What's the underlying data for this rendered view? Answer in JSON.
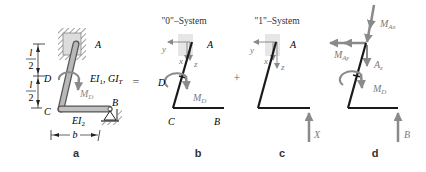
{
  "colors": {
    "beam": "#1a1a1a",
    "beam_3d_fill": "#9a9a9a",
    "beam_3d_edge": "#555555",
    "force_gray": "#8a8a8a",
    "label_gray": "#7a7a7a",
    "support_fill": "#e2e2e2",
    "hatch": "#444444"
  },
  "panels": {
    "a": {
      "caption": "a",
      "points": {
        "A": "A",
        "B": "B",
        "C": "C",
        "D": "D"
      },
      "stiffness_upper": "EI₁, GIᵀ",
      "stiffness_upper_parts": {
        "EI": "EI",
        "sub1": "1",
        "sep": ", ",
        "GI": "GI",
        "subT": "T"
      },
      "stiffness_lower_parts": {
        "EI": "EI",
        "sub2": "2"
      },
      "moment": {
        "M": "M",
        "sub": "D"
      },
      "dim_half_num": "l",
      "dim_half_den": "2",
      "dim_width": "b"
    },
    "b": {
      "caption": "b",
      "title": "\"0\"–System",
      "points": {
        "A": "A",
        "B": "B",
        "C": "C",
        "D": "D"
      },
      "axes": {
        "x": "x",
        "y": "y",
        "z": "z"
      },
      "moment": {
        "M": "M",
        "sub": "D"
      }
    },
    "c": {
      "caption": "c",
      "title": "\"1\"–System",
      "points": {
        "A": "A"
      },
      "axes": {
        "x": "x",
        "y": "y",
        "z": "z"
      },
      "force": "X"
    },
    "d": {
      "caption": "d",
      "reactions": {
        "MAx": {
          "M": "M",
          "sub": "Ax"
        },
        "MAy": {
          "M": "M",
          "sub": "Ay"
        },
        "Az": {
          "A": "A",
          "sub": "z"
        },
        "MD": {
          "M": "M",
          "sub": "D"
        },
        "B": "B"
      }
    }
  },
  "operators": {
    "equals": "=",
    "plus": "+"
  }
}
